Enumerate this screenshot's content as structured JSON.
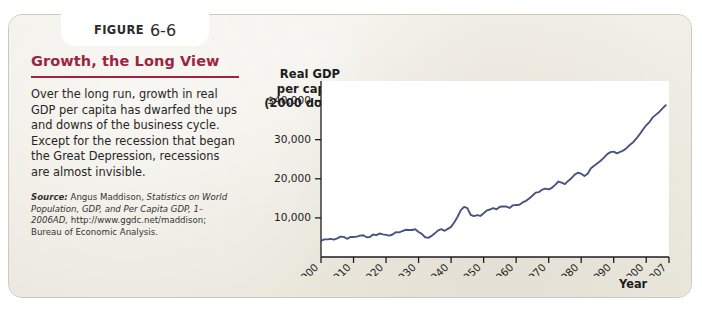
{
  "figure": {
    "tab_word": "FIGURE",
    "tab_number": "6-6",
    "title": "Growth, the Long View",
    "caption": "Over the long run, growth in real GDP per capita has dwarfed the ups and downs of the business cycle. Except for the recession that began the Great Depression, recessions are almost invisible.",
    "source_label": "Source:",
    "source_text_1": " Angus Maddison, ",
    "source_text_italic": "Statistics on World Population, GDP, and Per Capita GDP, 1–2006AD,",
    "source_text_2": " http://www.ggdc.net/maddison; Bureau of Economic Analysis.",
    "accent_color": "#9d2541",
    "panel_color": "#efece3"
  },
  "chart_data": {
    "type": "line",
    "title": "Growth, the Long View",
    "xlabel": "Year",
    "ylabel": "Real GDP per capita (2000 dollars)",
    "ylabel_lines": [
      "Real GDP",
      "per capita",
      "(2000 dollars)"
    ],
    "line_color": "#4a5282",
    "grid": false,
    "legend": "none",
    "xlim": [
      1900,
      2007
    ],
    "ylim": [
      0,
      45000
    ],
    "ytick_values": [
      10000,
      20000,
      30000,
      40000
    ],
    "ytick_labels": [
      "10,000",
      "20,000",
      "30,000",
      "$40,000"
    ],
    "xtick_values": [
      1900,
      1910,
      1920,
      1930,
      1940,
      1950,
      1960,
      1970,
      1980,
      1990,
      2000,
      2007
    ],
    "xtick_labels": [
      "1900",
      "1910",
      "1920",
      "1930",
      "1940",
      "1950",
      "1960",
      "1970",
      "1980",
      "1990",
      "2000",
      "2007"
    ],
    "x": [
      1900,
      1901,
      1902,
      1903,
      1904,
      1905,
      1906,
      1907,
      1908,
      1909,
      1910,
      1911,
      1912,
      1913,
      1914,
      1915,
      1916,
      1917,
      1918,
      1919,
      1920,
      1921,
      1922,
      1923,
      1924,
      1925,
      1926,
      1927,
      1928,
      1929,
      1930,
      1931,
      1932,
      1933,
      1934,
      1935,
      1936,
      1937,
      1938,
      1939,
      1940,
      1941,
      1942,
      1943,
      1944,
      1945,
      1946,
      1947,
      1948,
      1949,
      1950,
      1951,
      1952,
      1953,
      1954,
      1955,
      1956,
      1957,
      1958,
      1959,
      1960,
      1961,
      1962,
      1963,
      1964,
      1965,
      1966,
      1967,
      1968,
      1969,
      1970,
      1971,
      1972,
      1973,
      1974,
      1975,
      1976,
      1977,
      1978,
      1979,
      1980,
      1981,
      1982,
      1983,
      1984,
      1985,
      1986,
      1987,
      1988,
      1989,
      1990,
      1991,
      1992,
      1993,
      1994,
      1995,
      1996,
      1997,
      1998,
      1999,
      2000,
      2001,
      2002,
      2003,
      2004,
      2005,
      2006,
      2007
    ],
    "y": [
      4100,
      4500,
      4500,
      4620,
      4450,
      4750,
      5200,
      5150,
      4650,
      5100,
      5100,
      5200,
      5450,
      5550,
      5050,
      5100,
      5750,
      5600,
      6000,
      5800,
      5650,
      5450,
      5750,
      6350,
      6300,
      6600,
      6950,
      6900,
      6900,
      7100,
      6400,
      5900,
      5050,
      4900,
      5400,
      6050,
      6800,
      7100,
      6700,
      7200,
      7700,
      8900,
      10300,
      12000,
      12800,
      12500,
      10800,
      10450,
      10700,
      10500,
      11200,
      11900,
      12150,
      12500,
      12200,
      12850,
      12900,
      12900,
      12550,
      13200,
      13300,
      13350,
      13950,
      14350,
      14950,
      15650,
      16450,
      16600,
      17200,
      17500,
      17300,
      17700,
      18450,
      19300,
      19000,
      18650,
      19450,
      20150,
      21050,
      21550,
      21300,
      20700,
      21300,
      22700,
      23350,
      23950,
      24600,
      25400,
      26300,
      26800,
      26950,
      26500,
      26850,
      27250,
      27900,
      28700,
      29350,
      30300,
      31400,
      32600,
      33700,
      34500,
      35700,
      36400,
      37100,
      38000,
      38800
    ],
    "annotations": [
      "Great Depression trough near 1933",
      "World War II peak near 1944",
      "Steady expansion 1950–2007"
    ]
  }
}
